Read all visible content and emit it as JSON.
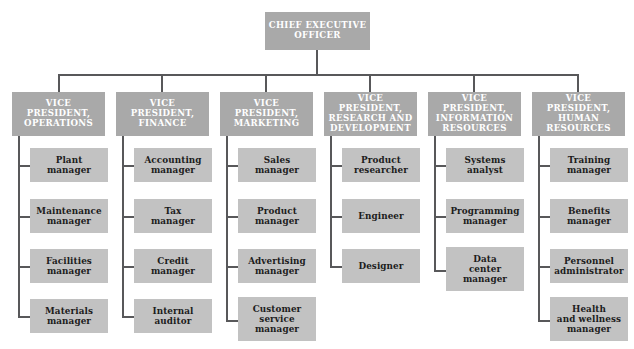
{
  "diagram": {
    "type": "organizational-chart",
    "colors": {
      "top_box_fill": "#a9a9a9",
      "top_box_text": "#ffffff",
      "sub_box_fill": "#c2c2c2",
      "sub_box_text": "#1c1c1c",
      "connector": "#58585a",
      "background": "#ffffff"
    },
    "root": {
      "label": "CHIEF EXECUTIVE\nOFFICER"
    },
    "divisions": [
      {
        "label": "VICE PRESIDENT,\nOPERATIONS",
        "reports": [
          {
            "label": "Plant\nmanager"
          },
          {
            "label": "Maintenance\nmanager"
          },
          {
            "label": "Facilities\nmanager"
          },
          {
            "label": "Materials\nmanager"
          }
        ]
      },
      {
        "label": "VICE PRESIDENT,\nFINANCE",
        "reports": [
          {
            "label": "Accounting\nmanager"
          },
          {
            "label": "Tax\nmanager"
          },
          {
            "label": "Credit\nmanager"
          },
          {
            "label": "Internal\nauditor"
          }
        ]
      },
      {
        "label": "VICE PRESIDENT,\nMARKETING",
        "reports": [
          {
            "label": "Sales\nmanager"
          },
          {
            "label": "Product\nmanager"
          },
          {
            "label": "Advertising\nmanager"
          },
          {
            "label": "Customer\nservice\nmanager"
          }
        ]
      },
      {
        "label": "VICE PRESIDENT,\nRESEARCH AND\nDEVELOPMENT",
        "reports": [
          {
            "label": "Product\nresearcher"
          },
          {
            "label": "Engineer"
          },
          {
            "label": "Designer"
          }
        ]
      },
      {
        "label": "VICE PRESIDENT,\nINFORMATION\nRESOURCES",
        "reports": [
          {
            "label": "Systems\nanalyst"
          },
          {
            "label": "Programming\nmanager"
          },
          {
            "label": "Data\ncenter\nmanager"
          }
        ]
      },
      {
        "label": "VICE PRESIDENT,\nHUMAN\nRESOURCES",
        "reports": [
          {
            "label": "Training\nmanager"
          },
          {
            "label": "Benefits\nmanager"
          },
          {
            "label": "Personnel\nadministrator"
          },
          {
            "label": "Health\nand wellness\nmanager"
          }
        ]
      }
    ]
  }
}
